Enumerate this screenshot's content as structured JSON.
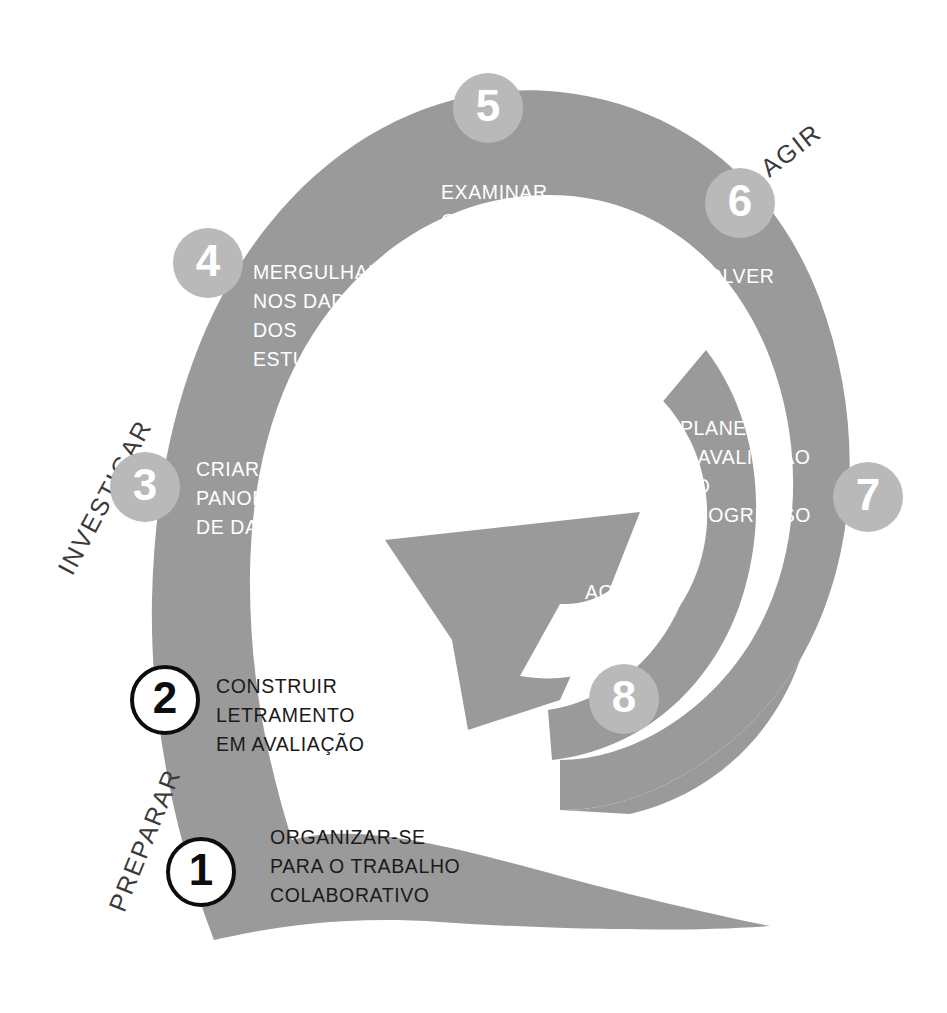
{
  "diagram": {
    "colors": {
      "spiral_gray": "#9a9a9a",
      "badge_gray": "#b9b9b9",
      "badge_text_light": "#ffffff",
      "outline_black": "#0d0d0d",
      "label_on_gray": "#ffffff",
      "label_on_white": "#1a1a1a",
      "phase_label": "#3a3a3a",
      "background": "#ffffff"
    }
  },
  "phases": [
    {
      "id": "preparar",
      "label": "PREPARAR",
      "rotation_deg": -68
    },
    {
      "id": "investigar",
      "label": "INVESTIGAR",
      "rotation_deg": -62
    },
    {
      "id": "agir",
      "label": "AGIR",
      "rotation_deg": -38
    }
  ],
  "steps": [
    {
      "number": "1",
      "label": "ORGANIZAR-SE\nPARA O TRABALHO\nCOLABORATIVO",
      "phase": "PREPARAR",
      "badge_style": "outlined",
      "label_on": "gray"
    },
    {
      "number": "2",
      "label": "CONSTRUIR\nLETRAMENTO\nEM AVALIAÇÃO",
      "phase": "PREPARAR",
      "badge_style": "outlined",
      "label_on": "gray"
    },
    {
      "number": "3",
      "label": "CRIAR UM\nPANORAMA\nDE DADOS",
      "phase": "INVESTIGAR",
      "badge_style": "filled",
      "label_on": "white"
    },
    {
      "number": "4",
      "label": "MERGULHAR\nNOS DADOS\nDOS\nESTUDANTES",
      "phase": "INVESTIGAR",
      "badge_style": "filled",
      "label_on": "white"
    },
    {
      "number": "5",
      "label": "EXAMINAR\nO ENSINO",
      "phase": "INVESTIGAR",
      "badge_style": "filled",
      "label_on": "white"
    },
    {
      "number": "6",
      "label": "DESENVOLVER\nUM PLANO\nDE AÇÃO",
      "phase": "AGIR",
      "badge_style": "filled",
      "label_on": "white"
    },
    {
      "number": "7",
      "label": "PLANEJAR\nA AVALIAÇÃO\nDO\nPROGRESSO",
      "phase": "AGIR",
      "badge_style": "filled",
      "label_on": "white"
    },
    {
      "number": "8",
      "label": "AGIR E\nAVALIAR",
      "phase": "AGIR",
      "badge_style": "filled",
      "label_on": "white"
    }
  ]
}
